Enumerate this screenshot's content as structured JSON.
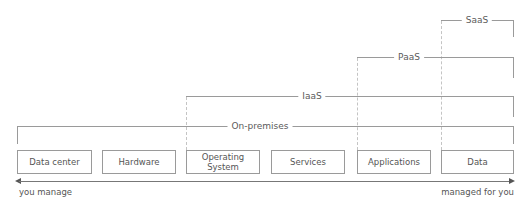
{
  "diagram": {
    "layers": [
      {
        "label": "Data center"
      },
      {
        "label": "Hardware"
      },
      {
        "label": "Operating System"
      },
      {
        "label": "Services"
      },
      {
        "label": "Applications"
      },
      {
        "label": "Data"
      }
    ],
    "brackets": [
      {
        "label": "On-premises",
        "spans_from": "Data center",
        "spans_to": "Data"
      },
      {
        "label": "IaaS",
        "spans_from": "Operating System",
        "spans_to": "Data"
      },
      {
        "label": "PaaS",
        "spans_from": "Applications",
        "spans_to": "Data"
      },
      {
        "label": "SaaS",
        "spans_from": "Data",
        "spans_to": "Data"
      }
    ],
    "axis": {
      "left_label": "you manage",
      "right_label": "managed for you"
    }
  }
}
